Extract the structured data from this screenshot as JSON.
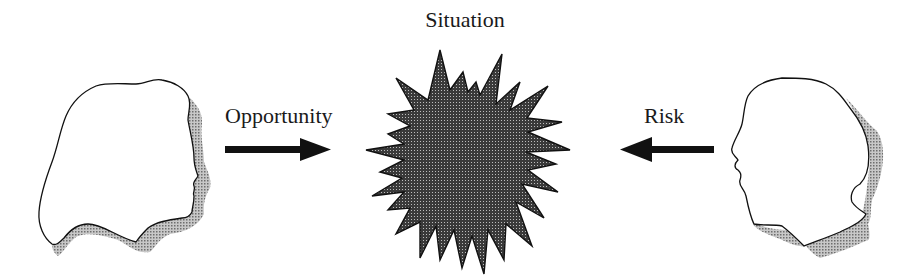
{
  "diagram": {
    "center": {
      "label": "Situation",
      "shape": "starburst"
    },
    "left": {
      "label": "Opportunity",
      "figure": "head-profile-facing-right",
      "arrow_direction": "right"
    },
    "right": {
      "label": "Risk",
      "figure": "head-profile-facing-left",
      "arrow_direction": "left"
    },
    "colors": {
      "stroke": "#111111",
      "shadow": "#9a9a9a",
      "burst_fill": "#4a4a4a",
      "background": "#ffffff"
    }
  }
}
